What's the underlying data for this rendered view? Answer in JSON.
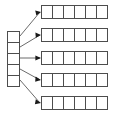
{
  "diagram": {
    "type": "block-diagram",
    "canvas": {
      "width": 115,
      "height": 119,
      "background": "#ffffff"
    },
    "colors": {
      "cell_stroke": "#4d4d4d",
      "cell_fill": "#ffffff",
      "connector": "#6b6b6b",
      "arrow_head": "#1a1a1a"
    },
    "index_column": {
      "name": "bucket-index-column",
      "x": 7,
      "y": 31,
      "width": 13,
      "cell_height": 11,
      "cell_count": 5,
      "cells": [
        {
          "label": ""
        },
        {
          "label": ""
        },
        {
          "label": ""
        },
        {
          "label": ""
        },
        {
          "label": ""
        }
      ]
    },
    "rows": [
      {
        "name": "row-1",
        "x": 41,
        "y": 5,
        "width": 66,
        "height": 14,
        "cell_count": 6,
        "cells": [
          {
            "label": ""
          },
          {
            "label": ""
          },
          {
            "label": ""
          },
          {
            "label": ""
          },
          {
            "label": ""
          },
          {
            "label": ""
          }
        ]
      },
      {
        "name": "row-2",
        "x": 41,
        "y": 28,
        "width": 66,
        "height": 14,
        "cell_count": 6,
        "cells": [
          {
            "label": ""
          },
          {
            "label": ""
          },
          {
            "label": ""
          },
          {
            "label": ""
          },
          {
            "label": ""
          },
          {
            "label": ""
          }
        ]
      },
      {
        "name": "row-3",
        "x": 41,
        "y": 51,
        "width": 66,
        "height": 14,
        "cell_count": 6,
        "cells": [
          {
            "label": ""
          },
          {
            "label": ""
          },
          {
            "label": ""
          },
          {
            "label": ""
          },
          {
            "label": ""
          },
          {
            "label": ""
          }
        ]
      },
      {
        "name": "row-4",
        "x": 41,
        "y": 73,
        "width": 66,
        "height": 14,
        "cell_count": 6,
        "cells": [
          {
            "label": ""
          },
          {
            "label": ""
          },
          {
            "label": ""
          },
          {
            "label": ""
          },
          {
            "label": ""
          },
          {
            "label": ""
          }
        ]
      },
      {
        "name": "row-5",
        "x": 41,
        "y": 96,
        "width": 66,
        "height": 14,
        "cell_count": 6,
        "cells": [
          {
            "label": ""
          },
          {
            "label": ""
          },
          {
            "label": ""
          },
          {
            "label": ""
          },
          {
            "label": ""
          },
          {
            "label": ""
          }
        ]
      }
    ],
    "connectors": [
      {
        "name": "connector-1",
        "from_index": 0,
        "to_row": 0,
        "x1": 20,
        "y1": 36,
        "x2": 41,
        "y2": 12
      },
      {
        "name": "connector-2",
        "from_index": 1,
        "to_row": 1,
        "x1": 20,
        "y1": 47,
        "x2": 41,
        "y2": 35
      },
      {
        "name": "connector-3",
        "from_index": 2,
        "to_row": 2,
        "x1": 20,
        "y1": 58,
        "x2": 41,
        "y2": 58
      },
      {
        "name": "connector-4",
        "from_index": 3,
        "to_row": 3,
        "x1": 20,
        "y1": 69,
        "x2": 41,
        "y2": 80
      },
      {
        "name": "connector-5",
        "from_index": 4,
        "to_row": 4,
        "x1": 20,
        "y1": 80,
        "x2": 41,
        "y2": 103
      }
    ]
  }
}
